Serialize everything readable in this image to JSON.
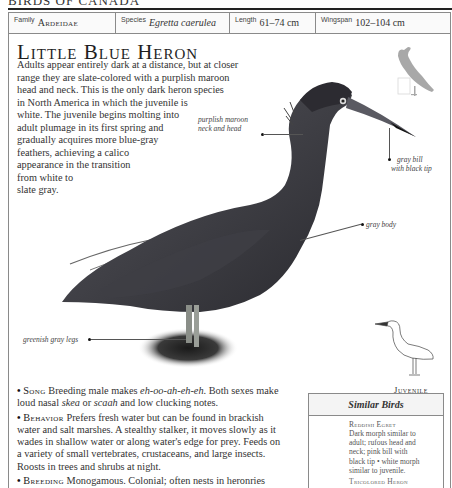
{
  "running_head": "BIRDS OF CANADA",
  "facts": {
    "family_label": "Family",
    "family_value": "Ardeidae",
    "species_label": "Species",
    "species_value": "Egretta caerulea",
    "length_label": "Length",
    "length_value": "61–74 cm",
    "wingspan_label": "Wingspan",
    "wingspan_value": "102–104 cm"
  },
  "title": "Little Blue Heron",
  "intro_lines": [
    "Adults appear entirely dark at a distance, but at closer",
    "range they are slate-colored with a purplish maroon",
    "head and neck. This is the only dark heron species",
    "in North America in which the juvenile is",
    "white. The juvenile begins molting into",
    "adult plumage in its first spring and",
    "gradually acquires more blue-gray",
    "feathers, achieving a calico",
    "appearance in the transition",
    "from white to",
    "slate gray."
  ],
  "annotations": {
    "neck": [
      "purplish maroon",
      "neck and head"
    ],
    "bill": [
      "gray bill",
      "with black tip"
    ],
    "body": [
      "gray body"
    ],
    "legs": [
      "greenish gray legs"
    ]
  },
  "juvenile_label": "Juvenile",
  "sections": {
    "song": {
      "heading": "Song",
      "lines": [
        [
          "Breeding male makes ",
          "eh-oo-ah-eh-eh",
          ". Both sexes make"
        ],
        [
          "loud nasal ",
          "skea",
          " or ",
          "scaah",
          " and low clucking notes."
        ]
      ]
    },
    "behavior": {
      "heading": "Behavior",
      "lines": [
        "Prefers fresh water but can be found in brackish",
        "water and salt marshes. A stealthy stalker, it moves slowly as it",
        "wades in shallow water or along water's edge for prey. Feeds on",
        "a variety of small vertebrates, crustaceans, and large insects.",
        "Roosts in trees and shrubs at night."
      ]
    },
    "breeding": {
      "heading": "Breeding",
      "lines": [
        "Monogamous. Colonial; often nests in heronries"
      ]
    }
  },
  "similar_birds": {
    "heading": "Similar Birds",
    "items": [
      {
        "name": "Reddish Egret",
        "desc_lines": [
          "Dark morph similar to",
          "adult; rufous head and",
          "neck; pink bill with",
          "black tip • white morph",
          "similar to juvenile."
        ]
      },
      {
        "name": "Tricolored Heron",
        "desc_lines": []
      }
    ]
  },
  "colors": {
    "frame": "#8a8a8a",
    "heron_dark": "#2e2e33",
    "heron_mid": "#4a4a50",
    "text": "#333333"
  }
}
